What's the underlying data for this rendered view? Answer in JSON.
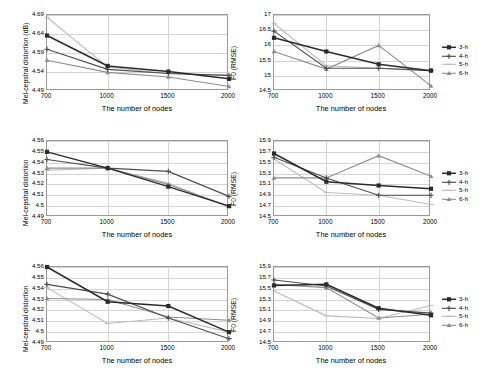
{
  "figure": {
    "panel_count": 6,
    "series_names": [
      "3-h",
      "4-h",
      "5-h",
      "6-h"
    ],
    "series_colors": [
      "#2b2b2b",
      "#4d4d4d",
      "#bcbcbc",
      "#8d8d8d"
    ],
    "xlabel": "The number of nodes",
    "xticks": [
      "700",
      "1000",
      "1500",
      "2000"
    ]
  },
  "legend": {
    "items": [
      {
        "label": "3-h",
        "color": "#2b2b2b",
        "marker": "square"
      },
      {
        "label": "4-h",
        "color": "#4d4d4d",
        "marker": "plus"
      },
      {
        "label": "5-h",
        "color": "#bcbcbc",
        "marker": "dash"
      },
      {
        "label": "6-h",
        "color": "#8d8d8d",
        "marker": "triangle"
      }
    ]
  },
  "chart_data": [
    {
      "id": "panel-r1c1",
      "type": "line",
      "title": "",
      "xlabel": "The number of nodes",
      "ylabel": "Mel-cepstral distortion (dB)",
      "categories": [
        "700",
        "1000",
        "1500",
        "2000"
      ],
      "x": [
        700,
        1000,
        1500,
        2000
      ],
      "ylim": [
        4.49,
        4.69
      ],
      "yticks": [
        "4.49",
        "4.54",
        "4.59",
        "4.64",
        "4.69"
      ],
      "ytick_values": [
        4.49,
        4.54,
        4.59,
        4.64,
        4.69
      ],
      "grid": true,
      "legend_position": "right",
      "series": [
        {
          "name": "3-h",
          "color": "#2b2b2b",
          "marker": "square",
          "values": [
            4.636,
            4.556,
            4.541,
            4.522
          ]
        },
        {
          "name": "4-h",
          "color": "#4d4d4d",
          "marker": "plus",
          "values": [
            4.6,
            4.547,
            4.536,
            4.531
          ]
        },
        {
          "name": "5-h",
          "color": "#bcbcbc",
          "marker": "dash",
          "values": [
            4.684,
            4.553,
            4.536,
            4.531
          ]
        },
        {
          "name": "6-h",
          "color": "#8d8d8d",
          "marker": "triangle",
          "values": [
            4.571,
            4.539,
            4.527,
            4.502
          ]
        }
      ]
    },
    {
      "id": "panel-r1c2",
      "type": "line",
      "title": "",
      "xlabel": "The number of nodes",
      "ylabel": "F0 (RMSE)",
      "categories": [
        "700",
        "1000",
        "1500",
        "2000"
      ],
      "x": [
        700,
        1000,
        1500,
        2000
      ],
      "ylim": [
        14.5,
        17.0
      ],
      "yticks": [
        "14.5",
        "15",
        "15.5",
        "16",
        "16.5",
        "17"
      ],
      "ytick_values": [
        14.5,
        15.0,
        15.5,
        16.0,
        16.5,
        17.0
      ],
      "grid": true,
      "legend_position": "right",
      "series": [
        {
          "name": "3-h",
          "color": "#2b2b2b",
          "marker": "square",
          "values": [
            16.25,
            15.8,
            15.38,
            15.17
          ]
        },
        {
          "name": "4-h",
          "color": "#4d4d4d",
          "marker": "plus",
          "values": [
            16.47,
            15.25,
            15.25,
            15.17
          ]
        },
        {
          "name": "5-h",
          "color": "#bcbcbc",
          "marker": "dash",
          "values": [
            16.72,
            15.33,
            15.25,
            15.17
          ]
        },
        {
          "name": "6-h",
          "color": "#8d8d8d",
          "marker": "triangle",
          "values": [
            15.8,
            15.22,
            16.0,
            14.67
          ]
        }
      ]
    },
    {
      "id": "panel-r2c1",
      "type": "line",
      "title": "",
      "xlabel": "The number of nodes",
      "ylabel": "Mel-cepstral distortion",
      "categories": [
        "700",
        "1000",
        "1500",
        "2000"
      ],
      "x": [
        700,
        1000,
        1500,
        2000
      ],
      "ylim": [
        4.49,
        4.56
      ],
      "yticks": [
        "4.49",
        "4.5",
        "4.51",
        "4.52",
        "4.53",
        "4.54",
        "4.55",
        "4.56"
      ],
      "ytick_values": [
        4.49,
        4.5,
        4.51,
        4.52,
        4.53,
        4.54,
        4.55,
        4.56
      ],
      "grid": true,
      "legend_position": "right",
      "series": [
        {
          "name": "3-h",
          "color": "#2b2b2b",
          "marker": "square",
          "values": [
            4.55,
            4.535,
            4.518,
            4.5
          ]
        },
        {
          "name": "4-h",
          "color": "#4d4d4d",
          "marker": "plus",
          "values": [
            4.543,
            4.535,
            4.532,
            4.509
          ]
        },
        {
          "name": "5-h",
          "color": "#bcbcbc",
          "marker": "dash",
          "values": [
            4.533,
            4.535,
            4.521,
            4.499
          ]
        },
        {
          "name": "6-h",
          "color": "#8d8d8d",
          "marker": "triangle",
          "values": [
            4.535,
            4.535,
            4.52,
            4.5
          ]
        }
      ]
    },
    {
      "id": "panel-r2c2",
      "type": "line",
      "title": "",
      "xlabel": "The number of nodes",
      "ylabel": "F0 (RMSE)",
      "categories": [
        "700",
        "1000",
        "1500",
        "2000"
      ],
      "x": [
        700,
        1000,
        1500,
        2000
      ],
      "ylim": [
        14.5,
        15.9
      ],
      "yticks": [
        "14.5",
        "14.7",
        "14.9",
        "15.1",
        "15.3",
        "15.5",
        "15.7",
        "15.9"
      ],
      "ytick_values": [
        14.5,
        14.7,
        14.9,
        15.1,
        15.3,
        15.5,
        15.7,
        15.9
      ],
      "grid": true,
      "legend_position": "right",
      "series": [
        {
          "name": "3-h",
          "color": "#2b2b2b",
          "marker": "square",
          "values": [
            15.67,
            15.15,
            15.08,
            15.02
          ]
        },
        {
          "name": "4-h",
          "color": "#4d4d4d",
          "marker": "plus",
          "values": [
            15.6,
            15.22,
            14.9,
            14.9
          ]
        },
        {
          "name": "5-h",
          "color": "#bcbcbc",
          "marker": "dash",
          "values": [
            15.57,
            14.95,
            14.9,
            14.73
          ]
        },
        {
          "name": "6-h",
          "color": "#8d8d8d",
          "marker": "triangle",
          "values": [
            15.22,
            15.22,
            15.63,
            15.25
          ]
        }
      ]
    },
    {
      "id": "panel-r3c1",
      "type": "line",
      "title": "",
      "xlabel": "The number of nodes",
      "ylabel": "Mel-cepstral distortion",
      "categories": [
        "700",
        "1000",
        "1500",
        "2000"
      ],
      "x": [
        700,
        1000,
        1500,
        2000
      ],
      "ylim": [
        4.49,
        4.56
      ],
      "yticks": [
        "4.49",
        "4.5",
        "4.51",
        "4.52",
        "4.53",
        "4.54",
        "4.55",
        "4.56"
      ],
      "ytick_values": [
        4.49,
        4.5,
        4.51,
        4.52,
        4.53,
        4.54,
        4.55,
        4.56
      ],
      "grid": true,
      "legend_position": "right",
      "series": [
        {
          "name": "3-h",
          "color": "#2b2b2b",
          "marker": "square",
          "values": [
            4.56,
            4.528,
            4.524,
            4.5
          ]
        },
        {
          "name": "4-h",
          "color": "#4d4d4d",
          "marker": "plus",
          "values": [
            4.544,
            4.535,
            4.513,
            4.494
          ]
        },
        {
          "name": "5-h",
          "color": "#bcbcbc",
          "marker": "dash",
          "values": [
            4.541,
            4.508,
            4.513,
            4.5
          ]
        },
        {
          "name": "6-h",
          "color": "#8d8d8d",
          "marker": "triangle",
          "values": [
            4.531,
            4.53,
            4.514,
            4.511
          ]
        }
      ]
    },
    {
      "id": "panel-r3c2",
      "type": "line",
      "title": "",
      "xlabel": "The number of nodes",
      "ylabel": "F0 (RMSE)",
      "categories": [
        "700",
        "1000",
        "1500",
        "2000"
      ],
      "x": [
        700,
        1000,
        1500,
        2000
      ],
      "ylim": [
        14.5,
        15.9
      ],
      "yticks": [
        "14.5",
        "14.7",
        "14.9",
        "15.1",
        "15.3",
        "15.5",
        "15.7",
        "15.9"
      ],
      "ytick_values": [
        14.5,
        14.7,
        14.9,
        15.1,
        15.3,
        15.5,
        15.7,
        15.9
      ],
      "grid": true,
      "legend_position": "right",
      "series": [
        {
          "name": "3-h",
          "color": "#2b2b2b",
          "marker": "square",
          "values": [
            15.56,
            15.58,
            15.14,
            15.01
          ]
        },
        {
          "name": "4-h",
          "color": "#4d4d4d",
          "marker": "plus",
          "values": [
            15.66,
            15.55,
            15.12,
            15.05
          ]
        },
        {
          "name": "5-h",
          "color": "#bcbcbc",
          "marker": "dash",
          "values": [
            15.46,
            15.0,
            14.95,
            15.19
          ]
        },
        {
          "name": "6-h",
          "color": "#8d8d8d",
          "marker": "triangle",
          "values": [
            15.58,
            15.52,
            14.96,
            15.03
          ]
        }
      ]
    }
  ]
}
